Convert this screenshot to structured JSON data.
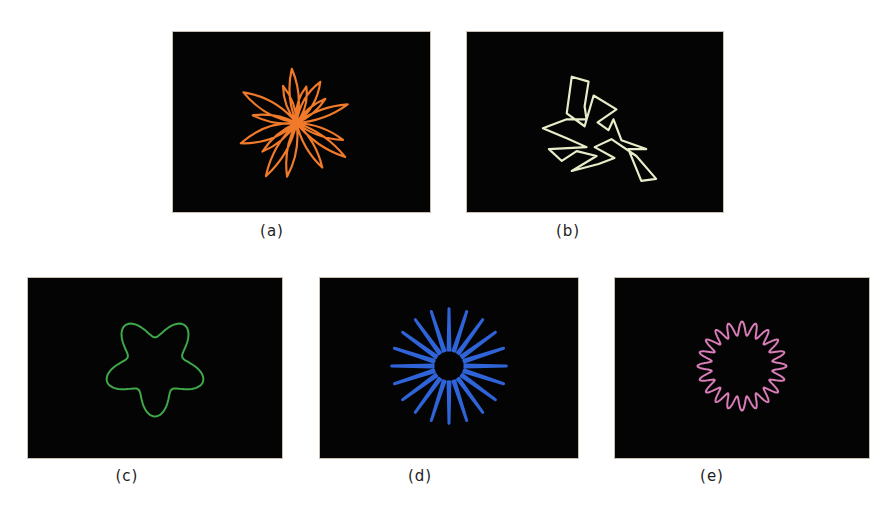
{
  "figure": {
    "background": "#050404",
    "panels": [
      {
        "id": "a",
        "caption": "(a)",
        "x": 172,
        "y": 31,
        "w": 259,
        "h": 182,
        "color": "#f07a2a",
        "kind": "random-petals",
        "stroke": 2.2
      },
      {
        "id": "b",
        "caption": "(b)",
        "x": 466,
        "y": 31,
        "w": 258,
        "h": 182,
        "color": "#e8edc9",
        "kind": "jagged",
        "stroke": 2.2
      },
      {
        "id": "c",
        "caption": "(c)",
        "x": 27,
        "y": 277,
        "w": 256,
        "h": 182,
        "color": "#3fa84a",
        "kind": "rose-star",
        "petals": 5,
        "stroke": 2
      },
      {
        "id": "d",
        "caption": "(d)",
        "x": 319,
        "y": 277,
        "w": 260,
        "h": 182,
        "color": "#2f63d8",
        "kind": "spikes",
        "petals": 20,
        "stroke": 3
      },
      {
        "id": "e",
        "caption": "(e)",
        "x": 614,
        "y": 277,
        "w": 256,
        "h": 182,
        "color": "#d97db8",
        "kind": "wavy-ring",
        "petals": 20,
        "stroke": 2
      }
    ],
    "captions_pos": [
      {
        "x": 272,
        "y": 232
      },
      {
        "x": 568,
        "y": 232
      },
      {
        "x": 127,
        "y": 477
      },
      {
        "x": 420,
        "y": 477
      },
      {
        "x": 712,
        "y": 477
      }
    ]
  }
}
